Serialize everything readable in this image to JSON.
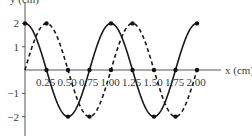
{
  "chart_data": {
    "type": "line",
    "title": "",
    "xlabel": "x (cm)",
    "ylabel": "y (cm)",
    "xlim": [
      0,
      2.25
    ],
    "ylim": [
      -2.5,
      2.5
    ],
    "x_ticks": [
      0.25,
      0.5,
      0.75,
      1.0,
      1.25,
      1.5,
      1.75,
      2.0
    ],
    "x_tick_labels": [
      "0.25",
      "0.50",
      "0.75",
      "1.00",
      "1.25",
      "1.50",
      "1.75",
      "2.00"
    ],
    "y_ticks": [
      2,
      1,
      -1,
      -2
    ],
    "y_tick_labels": [
      "2",
      "1",
      "−1",
      "−2"
    ],
    "grid": false,
    "legend": null,
    "series": [
      {
        "name": "solid wave",
        "style": "solid",
        "color": "#1a1a1a",
        "function": "2*cos(2*pi*x)",
        "amplitude": 2,
        "wavelength": 1.0,
        "phase_shift": 0,
        "x_range": [
          0,
          2.0
        ],
        "marked_points": [
          [
            0,
            2
          ],
          [
            0.5,
            -2
          ],
          [
            1.0,
            2
          ],
          [
            1.5,
            -2
          ],
          [
            2.0,
            2
          ]
        ]
      },
      {
        "name": "dashed wave",
        "style": "dashed",
        "color": "#1a1a1a",
        "function": "2*sin(2*pi*x)",
        "amplitude": 2,
        "wavelength": 1.0,
        "phase_shift": 0.25,
        "x_range": [
          0,
          2.0
        ],
        "marked_points": [
          [
            0.25,
            2
          ],
          [
            0.75,
            -2
          ],
          [
            1.25,
            2
          ],
          [
            1.75,
            -2
          ]
        ]
      }
    ],
    "axis_points": [
      0.25,
      0.5,
      0.75,
      1.0,
      1.25,
      1.5,
      1.75,
      2.0
    ]
  }
}
